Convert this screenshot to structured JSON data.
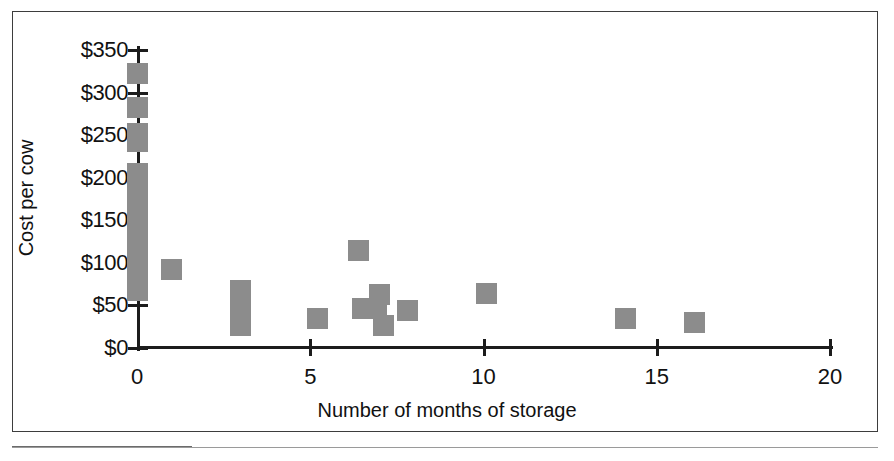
{
  "figure": {
    "kind": "scatter-plot",
    "marker_color": "#8c8c8c",
    "axis_color": "#1c1c1c",
    "frame_color": "#3d3d3d",
    "background": "#ffffff"
  },
  "chart_data": {
    "type": "scatter",
    "title": "",
    "xlabel": "Number of months of storage",
    "ylabel": "Cost per cow",
    "xlim": [
      0,
      20
    ],
    "ylim": [
      0,
      350
    ],
    "grid": false,
    "legend": null,
    "xticks": [
      0,
      5,
      10,
      15,
      20
    ],
    "xticklabels": [
      "0",
      "5",
      "10",
      "15",
      "20"
    ],
    "yticks": [
      0,
      50,
      100,
      150,
      200,
      250,
      300,
      350
    ],
    "yticklabels": [
      "$0",
      "$50",
      "$100",
      "$150",
      "$200",
      "$250",
      "$300",
      "$350"
    ],
    "marker_shape": "square",
    "points": [
      {
        "x": 0,
        "y": 322
      },
      {
        "x": 0,
        "y": 282
      },
      {
        "x": 0,
        "y": 252
      },
      {
        "x": 0,
        "y": 243
      },
      {
        "x": 0,
        "y": 205
      },
      {
        "x": 0,
        "y": 196
      },
      {
        "x": 0,
        "y": 172
      },
      {
        "x": 0,
        "y": 152
      },
      {
        "x": 0,
        "y": 143
      },
      {
        "x": 0,
        "y": 124
      },
      {
        "x": 0,
        "y": 113
      },
      {
        "x": 0,
        "y": 101
      },
      {
        "x": 0,
        "y": 92
      },
      {
        "x": 0,
        "y": 68
      },
      {
        "x": 1.0,
        "y": 92
      },
      {
        "x": 3.0,
        "y": 68
      },
      {
        "x": 3.0,
        "y": 56
      },
      {
        "x": 3.0,
        "y": 42
      },
      {
        "x": 3.0,
        "y": 26
      },
      {
        "x": 5.2,
        "y": 35
      },
      {
        "x": 6.4,
        "y": 115
      },
      {
        "x": 6.5,
        "y": 46
      },
      {
        "x": 6.9,
        "y": 46
      },
      {
        "x": 7.0,
        "y": 63
      },
      {
        "x": 7.1,
        "y": 26
      },
      {
        "x": 7.8,
        "y": 44
      },
      {
        "x": 10.1,
        "y": 64
      },
      {
        "x": 14.1,
        "y": 35
      },
      {
        "x": 16.1,
        "y": 30
      }
    ]
  }
}
